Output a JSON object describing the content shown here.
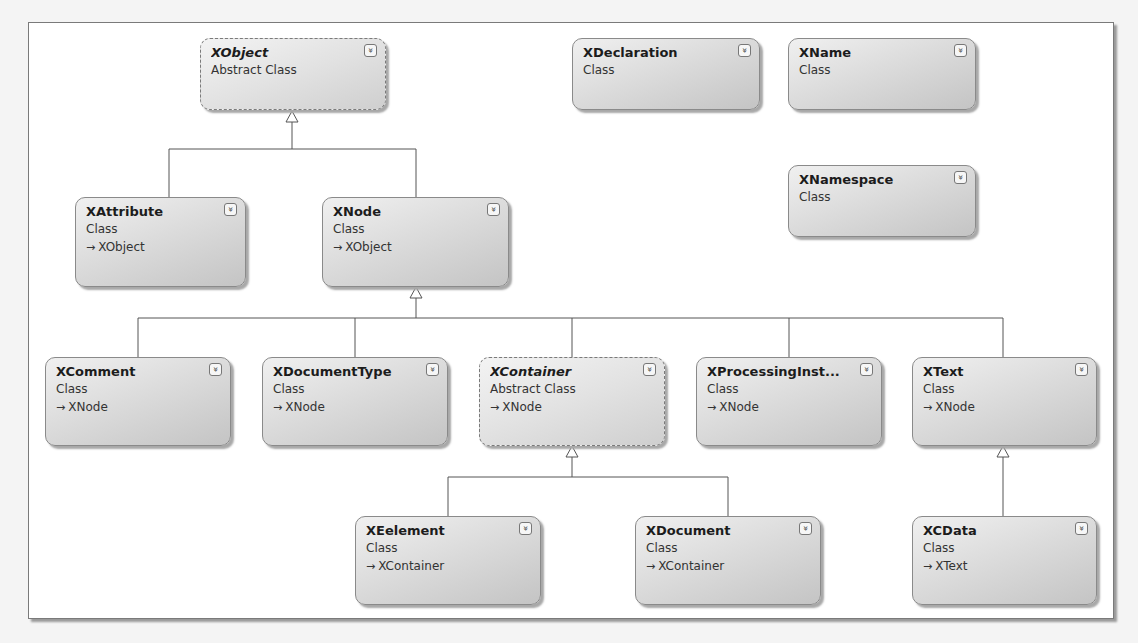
{
  "diagram": {
    "classes": [
      {
        "id": "xobject",
        "name": "XObject",
        "kind": "Abstract Class",
        "base": "",
        "abstract": true,
        "x": 200,
        "y": 38,
        "w": 186,
        "h": 72
      },
      {
        "id": "xdeclaration",
        "name": "XDeclaration",
        "kind": "Class",
        "base": "",
        "abstract": false,
        "x": 572,
        "y": 38,
        "w": 188,
        "h": 72
      },
      {
        "id": "xname",
        "name": "XName",
        "kind": "Class",
        "base": "",
        "abstract": false,
        "x": 788,
        "y": 38,
        "w": 188,
        "h": 72
      },
      {
        "id": "xnamespace",
        "name": "XNamespace",
        "kind": "Class",
        "base": "",
        "abstract": false,
        "x": 788,
        "y": 165,
        "w": 188,
        "h": 72
      },
      {
        "id": "xattribute",
        "name": "XAttribute",
        "kind": "Class",
        "base": "XObject",
        "abstract": false,
        "x": 75,
        "y": 197,
        "w": 171,
        "h": 90
      },
      {
        "id": "xnode",
        "name": "XNode",
        "kind": "Class",
        "base": "XObject",
        "abstract": false,
        "x": 322,
        "y": 197,
        "w": 187,
        "h": 90
      },
      {
        "id": "xcomment",
        "name": "XComment",
        "kind": "Class",
        "base": "XNode",
        "abstract": false,
        "x": 45,
        "y": 357,
        "w": 186,
        "h": 89
      },
      {
        "id": "xdocumenttype",
        "name": "XDocumentType",
        "kind": "Class",
        "base": "XNode",
        "abstract": false,
        "x": 262,
        "y": 357,
        "w": 186,
        "h": 89
      },
      {
        "id": "xcontainer",
        "name": "XContainer",
        "kind": "Abstract Class",
        "base": "XNode",
        "abstract": true,
        "x": 479,
        "y": 357,
        "w": 186,
        "h": 89
      },
      {
        "id": "xprocessinginstruction",
        "name": "XProcessingInst...",
        "kind": "Class",
        "base": "XNode",
        "abstract": false,
        "x": 696,
        "y": 357,
        "w": 186,
        "h": 89
      },
      {
        "id": "xtext",
        "name": "XText",
        "kind": "Class",
        "base": "XNode",
        "abstract": false,
        "x": 912,
        "y": 357,
        "w": 185,
        "h": 89
      },
      {
        "id": "xeelement",
        "name": "XEelement",
        "kind": "Class",
        "base": "XContainer",
        "abstract": false,
        "x": 355,
        "y": 516,
        "w": 186,
        "h": 89
      },
      {
        "id": "xdocument",
        "name": "XDocument",
        "kind": "Class",
        "base": "XContainer",
        "abstract": false,
        "x": 635,
        "y": 516,
        "w": 186,
        "h": 89
      },
      {
        "id": "xcdata",
        "name": "XCData",
        "kind": "Class",
        "base": "XText",
        "abstract": false,
        "x": 912,
        "y": 516,
        "w": 185,
        "h": 89
      }
    ],
    "expand_icon": "double-chevron-down",
    "base_arrow_glyph": "→",
    "colors": {
      "line": "#555555",
      "box_top": "#f0f0f0",
      "box_bottom": "#c4c4c4",
      "border": "#8a8a8a"
    }
  }
}
